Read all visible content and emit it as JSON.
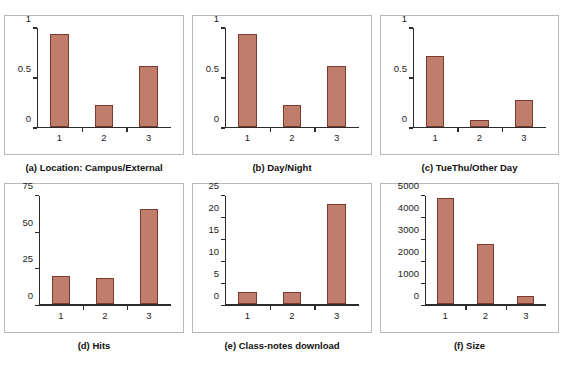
{
  "figure": {
    "background": "#ffffff",
    "bar_fill": "#c07d6b",
    "bar_edge": "#7a3b30",
    "axis_color": "#2b2b2b",
    "panel_border": "#b9b9bb"
  },
  "chart_data": [
    {
      "type": "bar",
      "panel_id": "a",
      "title": "(a) Location: Campus/External",
      "categories": [
        "1",
        "2",
        "3"
      ],
      "values": [
        0.94,
        0.23,
        0.62
      ],
      "xlabel": "",
      "ylabel": "",
      "ylim": [
        0,
        1
      ],
      "yticks": [
        0,
        0.5,
        1
      ],
      "ytick_labels": [
        "0",
        "0.5",
        "1"
      ],
      "grid": false,
      "legend": "none"
    },
    {
      "type": "bar",
      "panel_id": "b",
      "title": "(b) Day/Night",
      "categories": [
        "1",
        "2",
        "3"
      ],
      "values": [
        0.94,
        0.23,
        0.62
      ],
      "xlabel": "",
      "ylabel": "",
      "ylim": [
        0,
        1
      ],
      "yticks": [
        0,
        0.5,
        1
      ],
      "ytick_labels": [
        "0",
        "0.5",
        "1"
      ],
      "grid": false,
      "legend": "none"
    },
    {
      "type": "bar",
      "panel_id": "c",
      "title": "(c) TueThu/Other Day",
      "categories": [
        "1",
        "2",
        "3"
      ],
      "values": [
        0.72,
        0.08,
        0.28
      ],
      "xlabel": "",
      "ylabel": "",
      "ylim": [
        0,
        1
      ],
      "yticks": [
        0,
        0.5,
        1
      ],
      "ytick_labels": [
        "0",
        "0.5",
        "1"
      ],
      "grid": false,
      "legend": "none"
    },
    {
      "type": "bar",
      "panel_id": "d",
      "title": "(d) Hits",
      "categories": [
        "1",
        "2",
        "3"
      ],
      "values": [
        20,
        18.5,
        66
      ],
      "xlabel": "",
      "ylabel": "",
      "ylim": [
        0,
        75
      ],
      "yticks": [
        0,
        25,
        50,
        75
      ],
      "ytick_labels": [
        "0",
        "25",
        "50",
        "75"
      ],
      "grid": false,
      "legend": "none"
    },
    {
      "type": "bar",
      "panel_id": "e",
      "title": "(e) Class-notes download",
      "categories": [
        "1",
        "2",
        "3"
      ],
      "values": [
        3,
        3,
        23
      ],
      "xlabel": "",
      "ylabel": "",
      "ylim": [
        0,
        25
      ],
      "yticks": [
        0,
        5,
        10,
        15,
        20,
        25
      ],
      "ytick_labels": [
        "0",
        "5",
        "10",
        "15",
        "20",
        "25"
      ],
      "grid": false,
      "legend": "none"
    },
    {
      "type": "bar",
      "panel_id": "f",
      "title": "(f) Size",
      "categories": [
        "1",
        "2",
        "3"
      ],
      "values": [
        4880,
        2800,
        430
      ],
      "xlabel": "",
      "ylabel": "",
      "ylim": [
        0,
        5000
      ],
      "yticks": [
        0,
        1000,
        2000,
        3000,
        4000,
        5000
      ],
      "ytick_labels": [
        "0",
        "1000",
        "2000",
        "3000",
        "4000",
        "5000"
      ],
      "grid": false,
      "legend": "none"
    }
  ]
}
